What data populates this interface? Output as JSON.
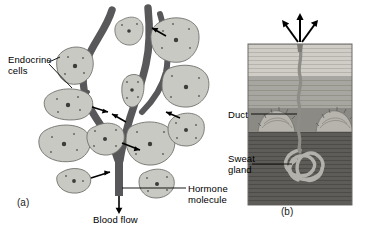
{
  "figure": {
    "background_color": "#ffffff"
  },
  "panels": [
    {
      "letter": "(a)",
      "name": "endocrine-gland-panel",
      "description": "Endocrine cells surrounding branching blood vessels, hormone molecules released into the bloodstream",
      "labels": [
        {
          "name": "endocrine-cells",
          "text": "Endocrine\ncells"
        },
        {
          "name": "hormone-molecule",
          "text": "Hormone\nmolecule"
        },
        {
          "name": "blood-flow",
          "text": "Blood flow"
        }
      ]
    },
    {
      "letter": "(b)",
      "name": "sweat-gland-panel",
      "description": "Cross-section of skin showing a coiled sweat gland and its duct opening onto the skin surface",
      "labels": [
        {
          "name": "duct",
          "text": "Duct"
        },
        {
          "name": "sweat-gland",
          "text": "Sweat\ngland"
        }
      ]
    }
  ],
  "colors": {
    "cell_fill": "#c9c9c4",
    "cell_stroke": "#6f6f6c",
    "vessel": "#58585a",
    "leader_line": "#000000",
    "text": "#000000",
    "epidermis": "#cfcdc6",
    "dermis_upper": "#a8a6a0",
    "dermis_lower": "#5e5c58",
    "duct": "#8f8d88",
    "gland_coil": "#b3b1ab"
  }
}
